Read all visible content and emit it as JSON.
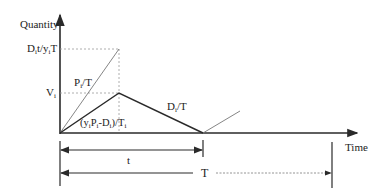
{
  "diagram": {
    "y_axis_label": "Quantity",
    "x_axis_label": "Time",
    "y_labels": {
      "top": {
        "main": "D",
        "sub": "i",
        "rest": "t/y",
        "sub2": "i",
        "tail": "T"
      },
      "peak": {
        "main": "V",
        "sub": "i"
      }
    },
    "line_labels": {
      "production": {
        "main": "P",
        "sub": "i",
        "tail": "/T"
      },
      "net_buildup": {
        "open": "(y",
        "s1": "i",
        "p": "P",
        "s2": "i",
        "d": "-D",
        "s3": "i",
        "close": ")/T",
        "s4": "i"
      },
      "demand": {
        "main": "D",
        "sub": "i",
        "tail": "/T"
      }
    },
    "intervals": {
      "t": "t",
      "T": "T"
    },
    "colors": {
      "axis": "#2a2a2a",
      "solid_line": "#2a2a2a",
      "thin_line": "#777777",
      "dashed_line": "#999999"
    }
  }
}
